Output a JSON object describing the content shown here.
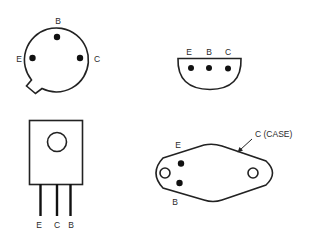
{
  "diagram": {
    "type": "transistor package pinouts",
    "packages": [
      {
        "id": "to18-metal-can",
        "shape": "circle-with-tab",
        "pins": [
          {
            "label": "B"
          },
          {
            "label": "E"
          },
          {
            "label": "C"
          }
        ]
      },
      {
        "id": "to92-plastic",
        "shape": "half-circle",
        "pins": [
          {
            "label": "E"
          },
          {
            "label": "B"
          },
          {
            "label": "C"
          }
        ]
      },
      {
        "id": "to220-power",
        "shape": "rectangle-with-leads",
        "pins": [
          {
            "label": "E"
          },
          {
            "label": "C"
          },
          {
            "label": "B"
          }
        ]
      },
      {
        "id": "to3-power-case",
        "shape": "diamond-with-mounting-holes",
        "pins": [
          {
            "label": "E"
          },
          {
            "label": "B"
          }
        ],
        "case_label": "C (CASE)"
      }
    ],
    "colors": {
      "line": "#222222",
      "background": "#ffffff"
    }
  }
}
